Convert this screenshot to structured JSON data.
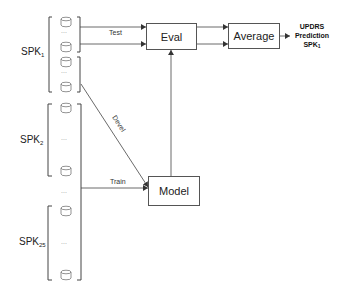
{
  "nodes": {
    "eval": {
      "label": "Eval"
    },
    "average": {
      "label": "Average"
    },
    "model": {
      "label": "Model"
    }
  },
  "speakers": [
    {
      "name": "SPK",
      "sub": "1"
    },
    {
      "name": "SPK",
      "sub": "2"
    },
    {
      "name": "SPK",
      "sub": "25"
    }
  ],
  "edges": {
    "test": "Test",
    "devel": "Devel",
    "train": "Train"
  },
  "output": {
    "line1": "UPDRS",
    "line2": "Prediction",
    "line3": "SPK",
    "line3_sub": "1"
  },
  "ellipsis": "...",
  "colors": {
    "stroke": "#555555",
    "text": "#222222"
  }
}
